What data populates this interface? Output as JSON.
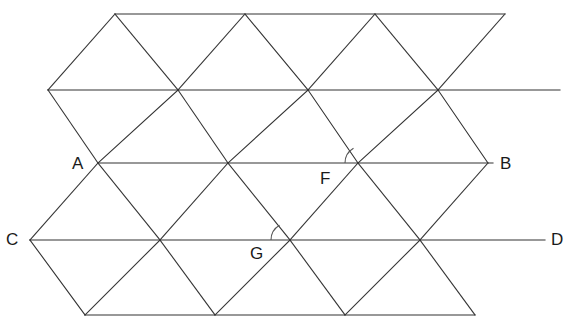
{
  "figure": {
    "canvas": {
      "width": 575,
      "height": 327
    },
    "style": {
      "background_color": "#ffffff",
      "stroke_color": "#333333",
      "stroke_width": 1.1,
      "label_color": "#1a1a1a",
      "label_font_size": 17,
      "arc_stroke_color": "#555555",
      "arc_stroke_width": 1.1
    },
    "geometry": {
      "row_spacing_px": 75.25,
      "column_spacing_px": 130,
      "half_column_px": 65,
      "rows": [
        {
          "index": 0,
          "y": 14,
          "x_start": 115,
          "x_end": 505
        },
        {
          "index": 1,
          "y": 90,
          "x_start": 48,
          "x_end": 560
        },
        {
          "index": 2,
          "y": 163,
          "x_start": 98,
          "x_end": 493
        },
        {
          "index": 3,
          "y": 240,
          "x_start": 30,
          "x_end": 545
        },
        {
          "index": 4,
          "y": 315,
          "x_start": 85,
          "x_end": 475
        }
      ]
    },
    "horizontal_lines": [
      {
        "name": "top-edge",
        "x1": 115,
        "y1": 14,
        "x2": 505,
        "y2": 14
      },
      {
        "name": "second-line",
        "x1": 48,
        "y1": 90,
        "x2": 560,
        "y2": 90
      },
      {
        "name": "line-AB",
        "x1": 98,
        "y1": 163,
        "x2": 493,
        "y2": 163
      },
      {
        "name": "line-CD",
        "x1": 30,
        "y1": 240,
        "x2": 545,
        "y2": 240
      },
      {
        "name": "bottom-edge",
        "x1": 85,
        "y1": 315,
        "x2": 475,
        "y2": 315
      }
    ],
    "down_right_lines": [
      {
        "x1": 115,
        "y1": 14,
        "x2": 560,
        "y2": 90
      },
      {
        "x1": 48,
        "y1": 90,
        "x2": 493,
        "y2": 163
      },
      {
        "x1": 98,
        "y1": 163,
        "x2": 545,
        "y2": 240
      },
      {
        "x1": 30,
        "y1": 240,
        "x2": 475,
        "y2": 315
      },
      {
        "x1": 245,
        "y1": 14,
        "x2": 560,
        "y2": 90
      },
      {
        "x1": 375,
        "y1": 14,
        "x2": 560,
        "y2": 90
      },
      {
        "x1": 505,
        "y1": 14,
        "x2": 560,
        "y2": 90
      }
    ],
    "down_left_lines": [
      {
        "x1": 505,
        "y1": 14,
        "x2": 48,
        "y2": 90
      },
      {
        "x1": 560,
        "y1": 90,
        "x2": 98,
        "y2": 163
      },
      {
        "x1": 493,
        "y1": 163,
        "x2": 30,
        "y2": 240
      },
      {
        "x1": 545,
        "y1": 240,
        "x2": 85,
        "y2": 315
      }
    ],
    "vertices": [
      {
        "name": "A",
        "x": 98,
        "y": 163,
        "label_x": 72,
        "label_y": 155,
        "label": "A"
      },
      {
        "name": "B",
        "x": 493,
        "y": 163,
        "label_x": 500,
        "label_y": 155,
        "label": "B"
      },
      {
        "name": "C",
        "x": 30,
        "y": 240,
        "label_x": 6,
        "label_y": 231,
        "label": "C"
      },
      {
        "name": "D",
        "x": 545,
        "y": 240,
        "label_x": 551,
        "label_y": 231,
        "label": "D"
      },
      {
        "name": "F",
        "x": 362,
        "y": 163,
        "label_x": 320,
        "label_y": 170,
        "label": "F"
      },
      {
        "name": "G",
        "x": 288,
        "y": 240,
        "label_x": 250,
        "label_y": 245,
        "label": "G"
      }
    ],
    "angle_arcs": [
      {
        "at_vertex": "F",
        "cx": 362,
        "cy": 163,
        "radius": 17,
        "start_deg": 180,
        "end_deg": 240
      },
      {
        "at_vertex": "G",
        "cx": 288,
        "cy": 240,
        "radius": 17,
        "start_deg": 180,
        "end_deg": 240
      }
    ]
  }
}
